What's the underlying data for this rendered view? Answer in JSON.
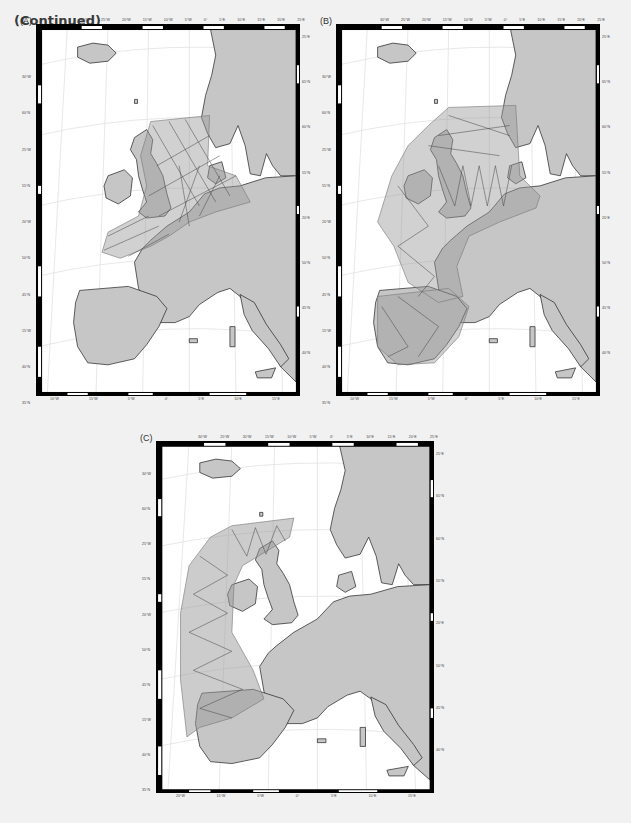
{
  "caption": "(Continued)",
  "colors": {
    "background": "#f1f1f1",
    "land": "#c8c8c8",
    "survey_area": "#bdbdbd",
    "track_lines": "#555555",
    "border": "#000000",
    "graticule": "#e6e6e6"
  },
  "panels": [
    {
      "label": "(A)",
      "top_ticks": [
        "30°W",
        "25°W",
        "20°W",
        "15°W",
        "10°W",
        "5°W",
        "0°",
        "5°E",
        "10°E",
        "15°E",
        "20°E",
        "25°E"
      ],
      "left_ticks": [
        "30°W",
        "60°N",
        "25°W",
        "55°N",
        "20°W",
        "50°N",
        "45°N",
        "15°W",
        "40°N",
        "35°N"
      ],
      "right_ticks": [
        "25°E",
        "65°N",
        "60°N",
        "55°N",
        "20°E",
        "50°N",
        "45°N",
        "40°N"
      ],
      "bottom_ticks": [
        "10°W",
        "15°W",
        "5°W",
        "0°",
        "5°E",
        "10°E",
        "15°E"
      ]
    },
    {
      "label": "(B)",
      "top_ticks": [
        "30°W",
        "25°W",
        "20°W",
        "15°W",
        "10°W",
        "5°W",
        "0°",
        "5°E",
        "10°E",
        "15°E",
        "20°E",
        "25°E"
      ],
      "left_ticks": [
        "30°W",
        "60°N",
        "25°W",
        "55°N",
        "20°W",
        "50°N",
        "45°N",
        "15°W",
        "40°N",
        "35°N"
      ],
      "right_ticks": [
        "25°E",
        "65°N",
        "60°N",
        "55°N",
        "20°E",
        "50°N",
        "45°N",
        "40°N"
      ],
      "bottom_ticks": [
        "10°W",
        "15°W",
        "5°W",
        "0°",
        "5°E",
        "10°E",
        "15°E"
      ]
    },
    {
      "label": "(C)",
      "top_ticks": [
        "30°W",
        "25°W",
        "20°W",
        "15°W",
        "10°W",
        "5°W",
        "0°",
        "5°E",
        "10°E",
        "15°E",
        "20°E",
        "25°E"
      ],
      "left_ticks": [
        "30°W",
        "60°N",
        "25°W",
        "55°N",
        "20°W",
        "50°N",
        "45°N",
        "15°W",
        "40°N",
        "35°N"
      ],
      "right_ticks": [
        "25°E",
        "65°N",
        "60°N",
        "55°N",
        "20°E",
        "50°N",
        "45°N",
        "40°N"
      ],
      "bottom_ticks": [
        "20°W",
        "15°W",
        "5°W",
        "0°",
        "5°E",
        "10°E",
        "15°E"
      ]
    }
  ]
}
